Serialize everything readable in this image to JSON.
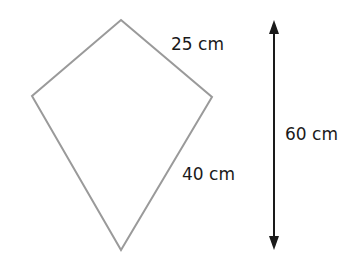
{
  "diagram": {
    "type": "kite",
    "colors": {
      "kite_stroke": "#9a9a9a",
      "arrow": "#1a1a1a",
      "text": "#1a1a1a",
      "background": "#ffffff"
    },
    "kite": {
      "vertices": {
        "top": [
          121,
          20
        ],
        "left": [
          32,
          96
        ],
        "right": [
          212,
          97
        ],
        "bottom": [
          121,
          250
        ]
      }
    },
    "labels": {
      "short_side": "25 cm",
      "long_side": "40 cm",
      "height": "60 cm"
    },
    "height_arrow": {
      "x": 274,
      "y_top": 20,
      "y_bottom": 250,
      "double_headed": true
    }
  }
}
